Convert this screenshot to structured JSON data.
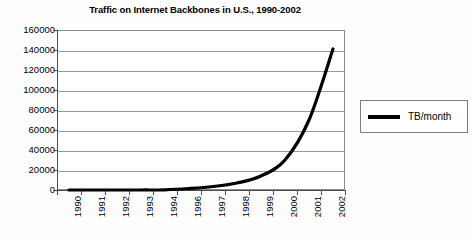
{
  "chart_data": {
    "type": "line",
    "title": "Traffic on Internet Backbones in U.S., 1990-2002",
    "xlabel": "",
    "ylabel": "",
    "ylim": [
      0,
      160000
    ],
    "grid": "horizontal",
    "legend_position": "right",
    "y_ticks": [
      "0",
      "20000",
      "40000",
      "60000",
      "80000",
      "100000",
      "120000",
      "140000",
      "160000"
    ],
    "y_tick_values": [
      0,
      20000,
      40000,
      60000,
      80000,
      100000,
      120000,
      140000,
      160000
    ],
    "categories": [
      "1990",
      "1991",
      "1992",
      "1993",
      "1994",
      "1996",
      "1997",
      "1998",
      "1999",
      "2000",
      "2001",
      "2002"
    ],
    "series": [
      {
        "name": "TB/month",
        "color": "#000000",
        "values": [
          1,
          2,
          5,
          20,
          200,
          1500,
          3500,
          7000,
          14000,
          30000,
          70000,
          141000
        ]
      }
    ],
    "legend": [
      "TB/month"
    ]
  },
  "legend": {
    "entry_label": "TB/month"
  }
}
